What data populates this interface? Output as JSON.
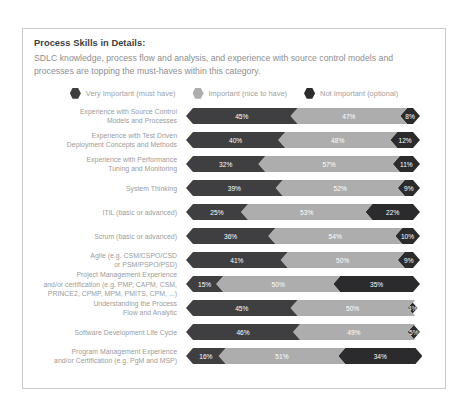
{
  "card": {
    "headline": "Process Skills in Details:",
    "subhead": "SDLC knowledge, process flow and analysis, and experience with source control models and processes are topping the must-haves within this category."
  },
  "colors": {
    "very_important": "#3f3f41",
    "important": "#adadad",
    "not_important": "#2b2b2d",
    "border": "#c9c9c9",
    "label_text": "#9b9b9d",
    "headline_text": "#3d3d3f",
    "subhead_text": "#8e8e90"
  },
  "legend": [
    {
      "label": "Very Important (must have)",
      "icon": "hexagon-icon",
      "color": "#3f3f41"
    },
    {
      "label": "Important (nice to have)",
      "icon": "hexagon-icon",
      "color": "#adadad"
    },
    {
      "label": "Not Important (optional)",
      "icon": "hexagon-icon",
      "color": "#2b2b2d"
    }
  ],
  "chart_data": {
    "type": "bar",
    "subtype": "stacked-horizontal-100",
    "title": "Process Skills in Details:",
    "subtitle": "SDLC knowledge, process flow and analysis, and experience with source control models and processes are topping the must-haves within this category.",
    "xlabel": "",
    "ylabel": "",
    "xlim": [
      0,
      100
    ],
    "grid": false,
    "legend_position": "top-center",
    "value_suffix": "%",
    "categories": [
      "Experience with Source Control Models and Processes",
      "Experience with Test Driven Deployment Concepts and Methods",
      "Experience with Performance Tuning and Monitoring",
      "System Thinking",
      "ITIL (basic or advanced)",
      "Scrum (basic or advanced)",
      "Agile (e.g. CSM/CSPO/CSD or PSM/PSPO/PSD)",
      "Project Management Experience and/or certification (e.g. PMP, CAPM, CSM, PRINCE2, CPMP, MPM, PMITS, CPM, ...)",
      "Understanding the Process Flow and Analytic",
      "Software Development Life Cycle",
      "Program Management Experience and/or Certification (e.g. PgM and MSP)"
    ],
    "series": [
      {
        "name": "Very Important (must have)",
        "color": "#3f3f41",
        "values": [
          45,
          40,
          32,
          39,
          25,
          36,
          41,
          15,
          45,
          46,
          16
        ]
      },
      {
        "name": "Important (nice to have)",
        "color": "#adadad",
        "values": [
          47,
          48,
          57,
          52,
          53,
          54,
          50,
          50,
          50,
          49,
          51
        ]
      },
      {
        "name": "Not Important (optional)",
        "color": "#2b2b2d",
        "values": [
          8,
          12,
          11,
          9,
          22,
          10,
          9,
          35,
          4,
          5,
          34
        ]
      }
    ]
  },
  "rows": [
    {
      "label_lines": [
        "Experience with Source Control",
        "Models and Processes"
      ],
      "segments": [
        {
          "value": 45,
          "text": "45%",
          "color": "#3f3f41"
        },
        {
          "value": 47,
          "text": "47%",
          "color": "#adadad"
        },
        {
          "value": 8,
          "text": "8%",
          "color": "#2b2b2d"
        }
      ]
    },
    {
      "label_lines": [
        "Experience with Test Driven",
        "Deployment Concepts and Methods"
      ],
      "segments": [
        {
          "value": 40,
          "text": "40%",
          "color": "#3f3f41"
        },
        {
          "value": 48,
          "text": "48%",
          "color": "#adadad"
        },
        {
          "value": 12,
          "text": "12%",
          "color": "#2b2b2d"
        }
      ]
    },
    {
      "label_lines": [
        "Experience with Performance",
        "Tuning and Monitoring"
      ],
      "segments": [
        {
          "value": 32,
          "text": "32%",
          "color": "#3f3f41"
        },
        {
          "value": 57,
          "text": "57%",
          "color": "#adadad"
        },
        {
          "value": 11,
          "text": "11%",
          "color": "#2b2b2d"
        }
      ]
    },
    {
      "label_lines": [
        "System Thinking"
      ],
      "segments": [
        {
          "value": 39,
          "text": "39%",
          "color": "#3f3f41"
        },
        {
          "value": 52,
          "text": "52%",
          "color": "#adadad"
        },
        {
          "value": 9,
          "text": "9%",
          "color": "#2b2b2d"
        }
      ]
    },
    {
      "label_lines": [
        "ITIL (basic or advanced)"
      ],
      "segments": [
        {
          "value": 25,
          "text": "25%",
          "color": "#3f3f41"
        },
        {
          "value": 53,
          "text": "53%",
          "color": "#adadad"
        },
        {
          "value": 22,
          "text": "22%",
          "color": "#2b2b2d"
        }
      ]
    },
    {
      "label_lines": [
        "Scrum (basic or advanced)"
      ],
      "segments": [
        {
          "value": 36,
          "text": "36%",
          "color": "#3f3f41"
        },
        {
          "value": 54,
          "text": "54%",
          "color": "#adadad"
        },
        {
          "value": 10,
          "text": "10%",
          "color": "#2b2b2d"
        }
      ]
    },
    {
      "label_lines": [
        "Agile (e.g. CSM/CSPO/CSD",
        "or PSM/PSPO/PSD)"
      ],
      "segments": [
        {
          "value": 41,
          "text": "41%",
          "color": "#3f3f41"
        },
        {
          "value": 50,
          "text": "50%",
          "color": "#adadad"
        },
        {
          "value": 9,
          "text": "9%",
          "color": "#2b2b2d"
        }
      ]
    },
    {
      "label_lines": [
        "Project Management Experience",
        "and/or certification (e.g. PMP, CAPM, CSM,",
        "PRINCE2, CPMP, MPM, PMITS, CPM, ...)"
      ],
      "segments": [
        {
          "value": 15,
          "text": "15%",
          "color": "#3f3f41"
        },
        {
          "value": 50,
          "text": "50%",
          "color": "#adadad"
        },
        {
          "value": 35,
          "text": "35%",
          "color": "#2b2b2d"
        }
      ]
    },
    {
      "label_lines": [
        "Understanding the Process",
        "Flow and Analytic"
      ],
      "segments": [
        {
          "value": 45,
          "text": "45%",
          "color": "#3f3f41"
        },
        {
          "value": 50,
          "text": "50%",
          "color": "#adadad"
        },
        {
          "value": 4,
          "text": "4%",
          "color": "#2b2b2d"
        }
      ]
    },
    {
      "label_lines": [
        "Software Development Life Cycle"
      ],
      "segments": [
        {
          "value": 46,
          "text": "46%",
          "color": "#3f3f41"
        },
        {
          "value": 49,
          "text": "49%",
          "color": "#adadad"
        },
        {
          "value": 5,
          "text": "5%",
          "color": "#2b2b2d"
        }
      ]
    },
    {
      "label_lines": [
        "Program Management Experience",
        "and/or Certification (e.g. PgM and MSP)"
      ],
      "segments": [
        {
          "value": 16,
          "text": "16%",
          "color": "#3f3f41"
        },
        {
          "value": 51,
          "text": "51%",
          "color": "#adadad"
        },
        {
          "value": 34,
          "text": "34%",
          "color": "#2b2b2d"
        }
      ]
    }
  ]
}
